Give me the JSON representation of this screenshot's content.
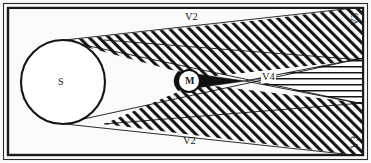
{
  "figure": {
    "background_color": "#fbfbfa",
    "ink_color": "#18181a",
    "umbra_fill": "#101010",
    "frame": {
      "outer_color": "#2b2b2b",
      "inner_color": "#1a1a1a"
    }
  },
  "bodies": {
    "source": {
      "label": "S",
      "cx": 63,
      "cy": 82,
      "r": 42,
      "fill": "#ffffff",
      "stroke": "#141414"
    },
    "occluder": {
      "label": "M",
      "cx": 189,
      "cy": 81,
      "r": 11,
      "fill": "#ffffff",
      "stroke": "#101010"
    }
  },
  "regions": [
    {
      "name": "umbra",
      "label": "",
      "hatch": "solid-black"
    },
    {
      "name": "penumbra-upper",
      "label": "V3",
      "hatch": "diagonal"
    },
    {
      "name": "penumbra-lower",
      "label": "V3",
      "hatch": "diagonal"
    },
    {
      "name": "antumbra",
      "label": "V4",
      "hatch": "horizontal"
    },
    {
      "name": "fully-lit-upper",
      "label": "V2",
      "hatch": "none"
    },
    {
      "name": "fully-lit-lower",
      "label": "V2",
      "hatch": "none"
    }
  ],
  "labels": {
    "source": "S",
    "occluder": "M",
    "lit_upper": "V2",
    "lit_lower": "V2",
    "penumbra_upper": "V3",
    "penumbra_lower": "V3",
    "antumbra": "V4"
  }
}
